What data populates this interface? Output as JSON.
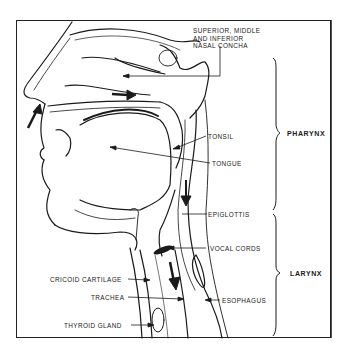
{
  "diagram": {
    "type": "anatomical cross-section",
    "labels": {
      "nasal_concha": [
        "SUPERIOR, MIDDLE",
        "AND INFERIOR",
        "NASAL CONCHA"
      ],
      "tonsil": "TONSIL",
      "tongue": "TONGUE",
      "epiglottis": "EPIGLOTTIS",
      "vocal_cords": "VOCAL CORDS",
      "esophagus": "ESOPHAGUS",
      "cricoid_cartilage": "CRICOID CARTILAGE",
      "trachea": "TRACHEA",
      "thyroid_gland": "THYROID GLAND"
    },
    "regions": {
      "pharynx": "PHARYNX",
      "larynx": "LARYNX"
    },
    "colors": {
      "ink": "#1a1a1a",
      "background": "#ffffff"
    }
  }
}
